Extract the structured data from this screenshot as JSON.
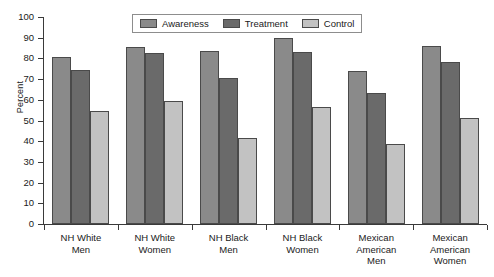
{
  "chart_data": {
    "type": "bar",
    "title": "",
    "xlabel": "",
    "ylabel": "Percent",
    "ylim": [
      0,
      100
    ],
    "ytick_step": 10,
    "yticks": [
      0,
      10,
      20,
      30,
      40,
      50,
      60,
      70,
      80,
      90,
      100
    ],
    "grid": false,
    "legend_position": "top-center",
    "categories": [
      "NH White Men",
      "NH White Women",
      "NH Black Men",
      "NH Black Women",
      "Mexican American Men",
      "Mexican American Women"
    ],
    "category_lines": [
      [
        "NH White",
        "Men"
      ],
      [
        "NH White",
        "Women"
      ],
      [
        "NH Black",
        "Men"
      ],
      [
        "NH Black",
        "Women"
      ],
      [
        "Mexican",
        "American",
        "Men"
      ],
      [
        "Mexican",
        "American",
        "Women"
      ]
    ],
    "series": [
      {
        "name": "Awareness",
        "color": "#8a8a8a",
        "values": [
          80.5,
          85.5,
          83.5,
          90.0,
          74.0,
          86.0
        ]
      },
      {
        "name": "Treatment",
        "color": "#6a6a6a",
        "values": [
          74.5,
          82.5,
          70.5,
          83.0,
          63.5,
          78.5
        ]
      },
      {
        "name": "Control",
        "color": "#c2c2c2",
        "values": [
          54.5,
          59.5,
          41.5,
          56.5,
          38.5,
          51.0
        ]
      }
    ]
  },
  "axis": {
    "y_title": "Percent"
  },
  "colors": {
    "axis": "#3a3a3a",
    "bar_border": "#4a4a4a",
    "legend_border": "#8d8d8d",
    "background": "#ffffff"
  }
}
